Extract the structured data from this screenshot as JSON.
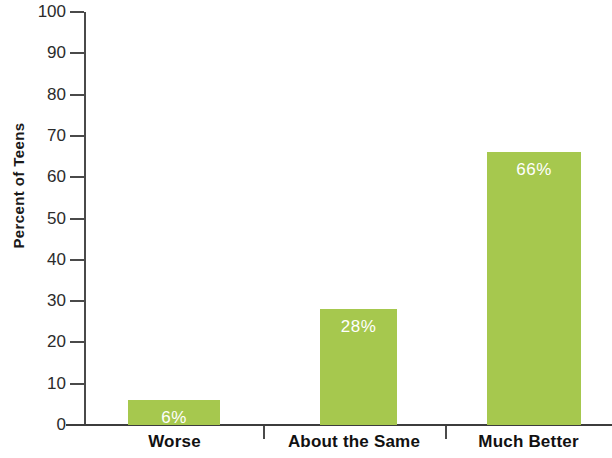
{
  "chart_data": {
    "type": "bar",
    "title": "",
    "subtitle": "",
    "xlabel": "",
    "ylabel": "Percent of Teens",
    "categories": [
      "Worse",
      "About the Same",
      "Much Better"
    ],
    "values": [
      6,
      28,
      66
    ],
    "value_labels": [
      "6%",
      "28%",
      "66%"
    ],
    "ylim": [
      0,
      100
    ],
    "y_ticks": [
      100,
      90,
      80,
      70,
      60,
      50,
      40,
      30,
      20,
      10,
      0
    ],
    "y_tick_labels": [
      "100",
      "90",
      "80",
      "70",
      "60",
      "50",
      "40",
      "30",
      "20",
      "10",
      "0"
    ],
    "grid": false,
    "legend": false,
    "legend_position": "none",
    "series": [
      {
        "name": "Percent of Teens",
        "values": [
          6,
          28,
          66
        ],
        "color": "#a6c84e"
      }
    ],
    "bar_color": "#a6c84e",
    "value_label_color": "#ffffff",
    "axis_color": "#4a4a4a",
    "background_color": "#ffffff"
  }
}
